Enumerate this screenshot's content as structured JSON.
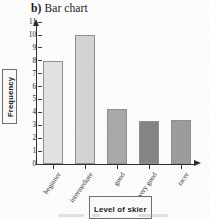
{
  "chart_data": {
    "type": "bar",
    "title": "b) Bar chart",
    "title_label": "b)",
    "title_text": "Bar chart",
    "xlabel": "Level of skier",
    "ylabel": "Frequency",
    "categories": [
      "beginner",
      "intermediate",
      "good",
      "very good",
      "racer"
    ],
    "values": [
      8,
      10,
      4.3,
      3.3,
      3.4
    ],
    "ylim": [
      0,
      11
    ],
    "yticks": [
      0,
      1,
      2,
      3,
      4,
      5,
      6,
      7,
      8,
      9,
      10,
      11
    ],
    "ytick_labels": [
      "0",
      "1",
      "2",
      "3",
      "4",
      "5",
      "6",
      "7",
      "8",
      "9",
      "10",
      "11"
    ],
    "grid": false,
    "legend": "none",
    "bar_colors": [
      "#e3e3e3",
      "#d4d4d4",
      "#a8a8a8",
      "#838383",
      "#9b9b9b"
    ],
    "bar_edge_color": "#8e8e8e",
    "axis_color": "#2a2a2a"
  }
}
